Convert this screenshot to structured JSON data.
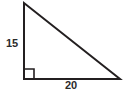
{
  "figure": {
    "kind": "right-triangle-diagram",
    "background_color": "#ffffff",
    "stroke_color": "#231f20",
    "text_color": "#2b2b2b",
    "labels": {
      "vertical_leg": "15",
      "horizontal_leg": "20"
    },
    "geometry": {
      "apex": [
        24,
        3
      ],
      "right_angle_vertex": [
        24,
        79
      ],
      "right_vertex": [
        120,
        79
      ],
      "right_angle_marker_size": 10,
      "stroke_width": 2
    }
  }
}
